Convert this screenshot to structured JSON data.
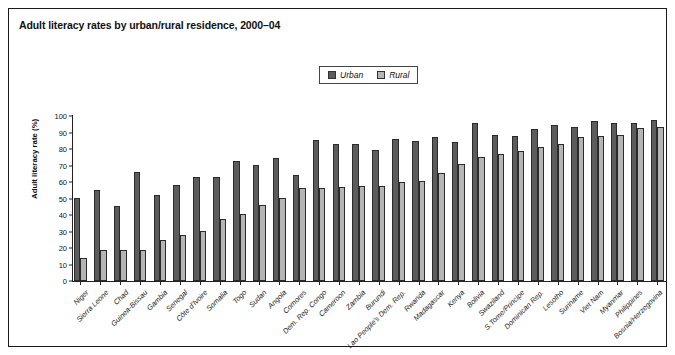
{
  "figure": {
    "title": "Adult literacy rates by urban/rural residence, 2000–04"
  },
  "legend": {
    "position": "top-center",
    "items": [
      {
        "label": "Urban",
        "color": "#5c5c5c"
      },
      {
        "label": "Rural",
        "color": "#b5b5b5"
      }
    ]
  },
  "chart_data": {
    "type": "bar",
    "title": "Adult literacy rates by urban/rural residence, 2000–04",
    "xlabel": "",
    "ylabel": "Adult literacy rate (%)",
    "ylim": [
      0,
      100
    ],
    "yticks": [
      0,
      10,
      20,
      30,
      40,
      50,
      60,
      70,
      80,
      90,
      100
    ],
    "grid": false,
    "legend_position": "top-center",
    "categories": [
      "Niger",
      "Sierra Leone",
      "Chad",
      "Guinea-Bissau",
      "Gambia",
      "Senegal",
      "Côte d'Ivoire",
      "Somalia",
      "Togo",
      "Sudan",
      "Angola",
      "Comores",
      "Dem. Rep. Congo",
      "Cameroon",
      "Zambia",
      "Burundi",
      "Lao People's Dem. Rep.",
      "Rwanda",
      "Madagascar",
      "Kenya",
      "Bolivia",
      "Swaziland",
      "S.Tome/Principe",
      "Dominican Rep.",
      "Lesotho",
      "Suriname",
      "Viet Nam",
      "Myanmar",
      "Philippines",
      "Bosnia/Herzegovina"
    ],
    "series": [
      {
        "name": "Urban",
        "color": "#5c5c5c",
        "values": [
          50.5,
          55.2,
          45.5,
          66.3,
          52.3,
          58.0,
          63.2,
          63.2,
          73.0,
          70.5,
          74.6,
          64.0,
          85.2,
          83.2,
          83.3,
          79.2,
          86.3,
          85.1,
          87.5,
          84.0,
          96.0,
          88.6,
          87.7,
          92.3,
          94.5,
          93.5,
          96.8,
          95.7,
          96.0,
          97.5
        ]
      },
      {
        "name": "Rural",
        "color": "#b5b5b5",
        "values": [
          13.8,
          18.6,
          18.8,
          19.1,
          24.9,
          28.1,
          30.3,
          37.5,
          40.6,
          46.1,
          50.2,
          56.1,
          56.2,
          57.0,
          57.3,
          57.4,
          60.1,
          60.7,
          65.5,
          70.7,
          75.3,
          76.8,
          78.9,
          81.4,
          82.8,
          87.4,
          88.0,
          88.2,
          92.8,
          93.5
        ]
      }
    ]
  }
}
